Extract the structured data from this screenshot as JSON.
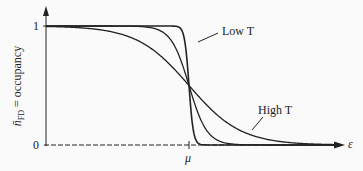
{
  "chart_data": {
    "type": "line",
    "title": "",
    "xlabel": "ε",
    "ylabel": "n̄_FD = occupancy",
    "x_ticks": [
      "μ"
    ],
    "y_ticks": [
      "0",
      "1"
    ],
    "ylim": [
      0,
      1
    ],
    "grid": false,
    "legend": "none (inline annotations)",
    "annotations": [
      "Low T",
      "High T"
    ],
    "series": [
      {
        "name": "Low T",
        "description": "Fermi-Dirac distribution, sharp step at μ",
        "x_rel_mu_kT": "steep",
        "values_at": {
          "far_below_mu": 1.0,
          "mu": 0.5,
          "far_above_mu": 0.0
        }
      },
      {
        "name": "Intermediate T",
        "description": "Fermi-Dirac distribution, moderate width",
        "values_at": {
          "far_below_mu": 1.0,
          "mu": 0.5,
          "far_above_mu": 0.0
        }
      },
      {
        "name": "High T",
        "description": "Fermi-Dirac distribution, broad",
        "values_at": {
          "far_below_mu": 0.98,
          "mu": 0.5,
          "far_above_mu": 0.0
        }
      }
    ]
  },
  "labels": {
    "y_one": "1",
    "y_zero": "0",
    "mu": "μ",
    "epsilon": "ε",
    "low_t": "Low T",
    "high_t": "High T",
    "ylabel_main": "n̄",
    "ylabel_sub": "FD",
    "ylabel_rest": " = occupancy"
  }
}
